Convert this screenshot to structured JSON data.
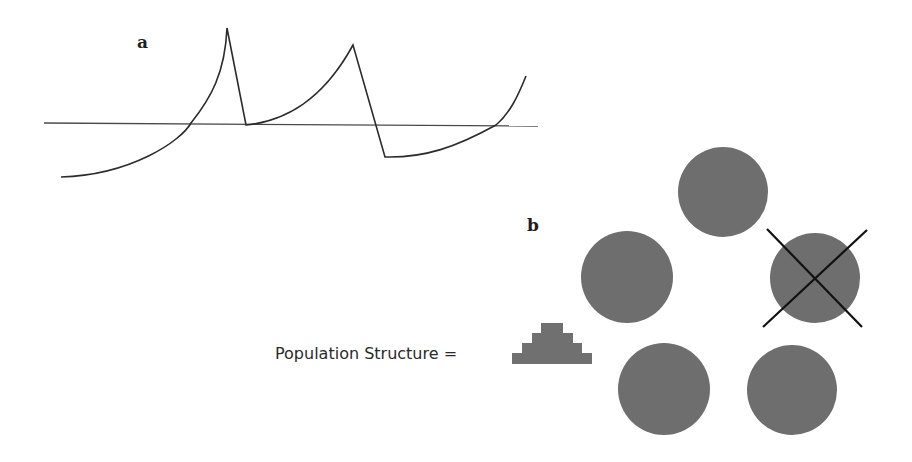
{
  "figure": {
    "panel_a": {
      "label": "a",
      "label_pos": [
        137,
        48
      ],
      "baseline": {
        "x1": 44,
        "y1": 123,
        "x2": 538,
        "y2": 126
      },
      "curve_points": {
        "start": [
          61,
          177
        ],
        "cross1": [
          191,
          123
        ],
        "peak1": [
          227,
          28
        ],
        "trough1": [
          246,
          125
        ],
        "peak2": [
          353,
          45
        ],
        "trough2": [
          385,
          157
        ],
        "cross2": [
          496,
          125
        ],
        "end": [
          526,
          76
        ]
      }
    },
    "panel_b": {
      "label": "b",
      "label_pos": [
        527,
        231
      ],
      "caption": "Population Structure =",
      "caption_pos": [
        275,
        359
      ],
      "pyramid_icon": {
        "name": "population-pyramid-icon",
        "rows": [
          {
            "x": 541,
            "y": 323,
            "w": 22,
            "h": 10
          },
          {
            "x": 532,
            "y": 333,
            "w": 41,
            "h": 10
          },
          {
            "x": 522,
            "y": 343,
            "w": 60,
            "h": 10
          },
          {
            "x": 512,
            "y": 353,
            "w": 80,
            "h": 11
          }
        ]
      },
      "populations": [
        {
          "id": "top",
          "cx": 723,
          "cy": 192,
          "r": 45,
          "extinct": false
        },
        {
          "id": "left",
          "cx": 627,
          "cy": 277,
          "r": 46,
          "extinct": false
        },
        {
          "id": "right",
          "cx": 815,
          "cy": 278,
          "r": 45,
          "extinct": true
        },
        {
          "id": "bottom-left",
          "cx": 664,
          "cy": 389,
          "r": 46,
          "extinct": false
        },
        {
          "id": "bottom-right",
          "cx": 792,
          "cy": 390,
          "r": 45,
          "extinct": false
        }
      ],
      "cross": {
        "line1": [
          767,
          229,
          862,
          327
        ],
        "line2": [
          867,
          230,
          763,
          327
        ]
      }
    },
    "colors": {
      "circle_fill": "#6e6e6e",
      "line": "#2b2b2b",
      "cross": "#111111",
      "text": "#2a2a2a"
    }
  }
}
